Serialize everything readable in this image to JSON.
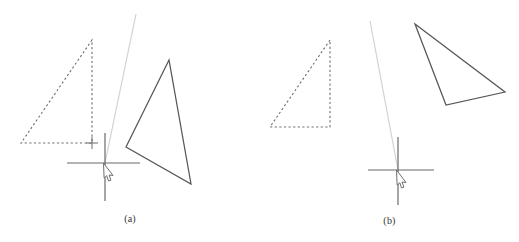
{
  "figure": {
    "background_color": "#ffffff",
    "width": 519,
    "height": 242
  },
  "colors": {
    "solid_stroke": "#565656",
    "dashed_stroke": "#6e6e6e",
    "axis_stroke": "#6a6a6a",
    "ray_stroke": "#d2d2d2",
    "cursor_stroke": "#707070",
    "caption_text": "#333333"
  },
  "panels": [
    {
      "id": "a",
      "caption": "(a)",
      "dashed_triangle": {
        "name": "dashed-triangle",
        "points": [
          [
            92,
            40
          ],
          [
            21,
            143
          ],
          [
            92,
            143
          ]
        ],
        "style": "dashed"
      },
      "solid_triangle": {
        "name": "solid-triangle",
        "points": [
          [
            169,
            60
          ],
          [
            126,
            147
          ],
          [
            191,
            184
          ]
        ],
        "style": "solid"
      },
      "axes": {
        "center": [
          105,
          163
        ],
        "horizontal": {
          "x1": 67,
          "y1": 163,
          "x2": 140,
          "y2": 163
        },
        "vertical": {
          "x1": 105,
          "y1": 133,
          "x2": 105,
          "y2": 201
        }
      },
      "ray": {
        "x1": 136,
        "y1": 14,
        "x2": 105,
        "y2": 163
      },
      "cursor": {
        "x": 105,
        "y": 163
      },
      "tick_marker": {
        "x": 92,
        "y": 143
      }
    },
    {
      "id": "b",
      "caption": "(b)",
      "dashed_triangle": {
        "name": "dashed-triangle",
        "points": [
          [
            330,
            40
          ],
          [
            270,
            127
          ],
          [
            330,
            127
          ]
        ],
        "style": "dashed"
      },
      "solid_triangle": {
        "name": "solid-triangle",
        "points": [
          [
            415,
            24
          ],
          [
            505,
            92
          ],
          [
            446,
            105
          ]
        ],
        "style": "solid"
      },
      "axes": {
        "center": [
          398,
          170
        ],
        "horizontal": {
          "x1": 368,
          "y1": 170,
          "x2": 434,
          "y2": 170
        },
        "vertical": {
          "x1": 398,
          "y1": 137,
          "x2": 398,
          "y2": 205
        }
      },
      "ray": {
        "x1": 370,
        "y1": 21,
        "x2": 398,
        "y2": 170
      },
      "cursor": {
        "x": 398,
        "y": 170
      }
    }
  ]
}
